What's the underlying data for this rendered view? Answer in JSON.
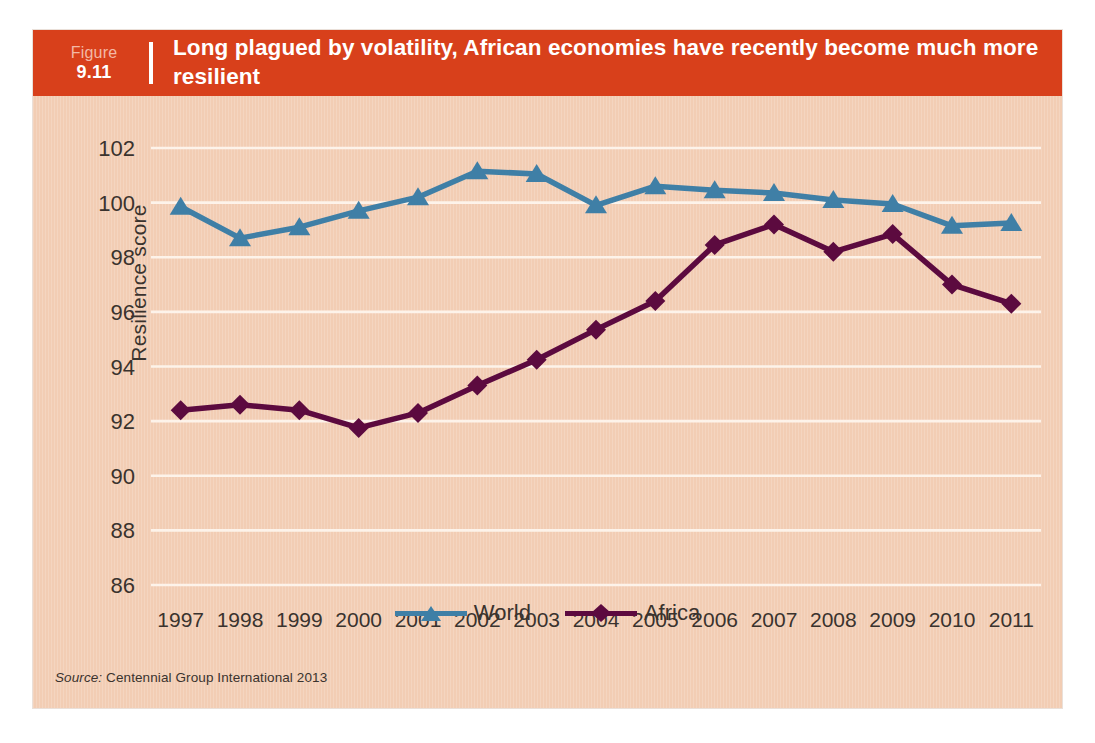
{
  "figure": {
    "label_word": "Figure",
    "number": "9.11",
    "title": "Long plagued by volatility, African economies have recently become much more resilient"
  },
  "source": {
    "prefix": "Source:",
    "text": " Centennial Group International 2013"
  },
  "colors": {
    "header_red": "#d8401b",
    "panel_background": "#f2cdb4",
    "gridline": "#fdf3ea",
    "world": "#3f7fa6",
    "africa": "#5c0a3f",
    "text": "#3a332e"
  },
  "chart_data": {
    "type": "line",
    "title": "Long plagued by volatility, African economies have recently become much more resilient",
    "xlabel": "",
    "ylabel": "Resilience score",
    "categories": [
      "1997",
      "1998",
      "1999",
      "2000",
      "2001",
      "2002",
      "2003",
      "2004",
      "2005",
      "2006",
      "2007",
      "2008",
      "2009",
      "2010",
      "2011"
    ],
    "ylim": [
      86,
      102
    ],
    "yticks": [
      86,
      88,
      90,
      92,
      94,
      96,
      98,
      100,
      102
    ],
    "grid": true,
    "legend_position": "bottom-center",
    "series": [
      {
        "name": "World",
        "color": "#3f7fa6",
        "marker": "triangle",
        "values": [
          99.85,
          98.7,
          99.1,
          99.7,
          100.2,
          101.15,
          101.05,
          99.9,
          100.6,
          100.45,
          100.35,
          100.1,
          99.95,
          99.15,
          99.25
        ]
      },
      {
        "name": "Africa",
        "color": "#5c0a3f",
        "marker": "diamond",
        "values": [
          92.4,
          92.6,
          92.4,
          91.75,
          92.3,
          93.3,
          94.25,
          95.35,
          96.4,
          98.45,
          99.2,
          98.2,
          98.85,
          97.0,
          96.3
        ]
      }
    ]
  }
}
